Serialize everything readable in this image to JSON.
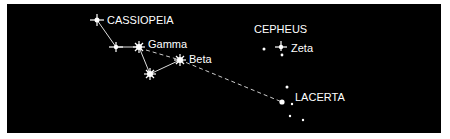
{
  "figure": {
    "background": "#000000",
    "star_color": "#ffffff",
    "labels": {
      "cassiopeia": "CASSIOPEIA",
      "gamma": "Gamma",
      "beta": "Beta",
      "cepheus": "CEPHEUS",
      "zeta": "Zeta",
      "lacerta": "LACERTA"
    },
    "constellations": [
      {
        "name": "CASSIOPEIA",
        "stars": [
          "Cassiopeia top star",
          "second star",
          "Gamma",
          "lower star",
          "Beta"
        ]
      },
      {
        "name": "CEPHEUS",
        "stars": [
          "small star",
          "Zeta",
          "star below Zeta"
        ]
      },
      {
        "name": "LACERTA",
        "stars": [
          "upper star",
          "bright star",
          "small star",
          "lower star 1",
          "lower star 2"
        ]
      }
    ],
    "pointer_line": {
      "style": "dashed",
      "from": "Gamma",
      "through": "Beta",
      "to": "LACERTA"
    }
  }
}
